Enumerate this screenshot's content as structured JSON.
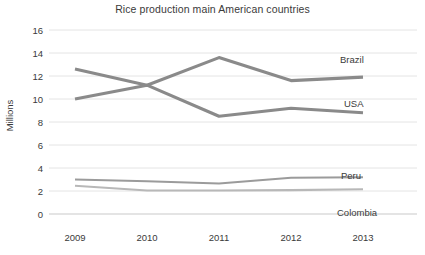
{
  "chart_data": {
    "type": "line",
    "title": "Rice production main American countries",
    "xlabel": "",
    "ylabel": "Millions",
    "categories": [
      "2009",
      "2010",
      "2011",
      "2012",
      "2013"
    ],
    "x": [
      2009,
      2010,
      2011,
      2012,
      2013
    ],
    "ylim": [
      0,
      16
    ],
    "ytick_step": 2,
    "yticks": [
      "16",
      "14",
      "12",
      "10",
      "8",
      "6",
      "4",
      "2",
      "0"
    ],
    "grid": "horizontal",
    "legend_position": "right-inline-labels",
    "series": [
      {
        "name": "Brazil",
        "values": [
          12.6,
          11.2,
          13.6,
          11.6,
          11.9
        ],
        "color": "#8a8a8a"
      },
      {
        "name": "USA",
        "values": [
          10.0,
          11.2,
          8.5,
          9.2,
          8.8
        ],
        "color": "#8a8a8a"
      },
      {
        "name": "Peru",
        "values": [
          3.0,
          2.85,
          2.65,
          3.15,
          3.2
        ],
        "color": "#9b9b9b"
      },
      {
        "name": "Colombia",
        "values": [
          2.45,
          2.05,
          2.05,
          2.08,
          2.15
        ],
        "color": "#b8b8b8"
      }
    ]
  },
  "chart": {
    "title": "Rice production main American countries",
    "y_axis_title": "Millions",
    "y_tick_labels": [
      "16",
      "14",
      "12",
      "10",
      "8",
      "6",
      "4",
      "2",
      "0"
    ],
    "x_tick_labels": [
      "2009",
      "2010",
      "2011",
      "2012",
      "2013"
    ],
    "series_labels": {
      "brazil": "Brazil",
      "usa": "USA",
      "peru": "Peru",
      "colombia": "Colombia"
    },
    "colors": {
      "brazil": "#8a8a8a",
      "usa": "#8a8a8a",
      "peru": "#9b9b9b",
      "colombia": "#b8b8b8",
      "gridline": "#e4e4e4",
      "text": "#3a3a3a",
      "background": "#ffffff"
    }
  }
}
